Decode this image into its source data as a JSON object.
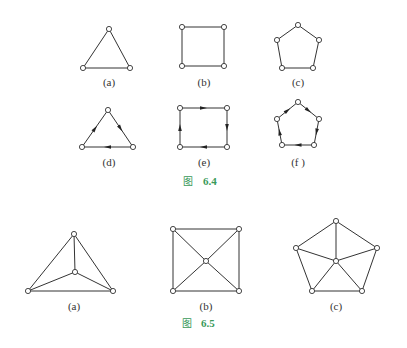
{
  "figures": [
    {
      "id": "fig-6-4",
      "caption": {
        "char": "图",
        "number": "6.4",
        "x": 190,
        "y": 184
      },
      "subfigures": [
        {
          "label": "(a)",
          "label_pos": [
            109,
            86
          ],
          "vertices": [
            [
              109,
              29
            ],
            [
              83,
              68
            ],
            [
              130,
              68
            ]
          ],
          "edges": [
            [
              0,
              1
            ],
            [
              0,
              2
            ],
            [
              1,
              2
            ]
          ],
          "directed": false
        },
        {
          "label": "(b)",
          "label_pos": [
            204,
            86
          ],
          "vertices": [
            [
              182,
              27
            ],
            [
              224,
              27
            ],
            [
              224,
              66
            ],
            [
              182,
              66
            ]
          ],
          "edges": [
            [
              0,
              1
            ],
            [
              1,
              2
            ],
            [
              2,
              3
            ],
            [
              3,
              0
            ]
          ],
          "directed": false
        },
        {
          "label": "(c)",
          "label_pos": [
            298,
            86
          ],
          "vertices": [
            [
              298,
              25
            ],
            [
              319,
              40
            ],
            [
              313,
              68
            ],
            [
              282,
              68
            ],
            [
              277,
              40
            ]
          ],
          "edges": [
            [
              0,
              1
            ],
            [
              1,
              2
            ],
            [
              2,
              3
            ],
            [
              3,
              4
            ],
            [
              4,
              0
            ]
          ],
          "directed": false
        },
        {
          "label": "(d)",
          "label_pos": [
            109,
            166
          ],
          "vertices": [
            [
              108,
              110
            ],
            [
              133,
              147
            ],
            [
              82,
              147
            ]
          ],
          "edges": [
            [
              0,
              1
            ],
            [
              1,
              2
            ],
            [
              2,
              0
            ]
          ],
          "directed": true
        },
        {
          "label": "(e)",
          "label_pos": [
            204,
            166
          ],
          "vertices": [
            [
              180,
              108
            ],
            [
              227,
              108
            ],
            [
              227,
              147
            ],
            [
              180,
              147
            ]
          ],
          "edges": [
            [
              0,
              1
            ],
            [
              1,
              2
            ],
            [
              2,
              3
            ],
            [
              3,
              0
            ]
          ],
          "directed": true
        },
        {
          "label": "(f )",
          "label_pos": [
            298,
            166
          ],
          "vertices": [
            [
              298,
              102
            ],
            [
              319,
              119
            ],
            [
              314,
              145
            ],
            [
              282,
              145
            ],
            [
              277,
              119
            ]
          ],
          "edges": [
            [
              0,
              1
            ],
            [
              1,
              2
            ],
            [
              2,
              3
            ],
            [
              3,
              4
            ],
            [
              4,
              0
            ]
          ],
          "directed": true
        }
      ]
    },
    {
      "id": "fig-6-5",
      "caption": {
        "char": "图",
        "number": "6.5",
        "x": 189,
        "y": 326
      },
      "subfigures": [
        {
          "label": "(a)",
          "label_pos": [
            74,
            310
          ],
          "vertices": [
            [
              74,
              234
            ],
            [
              28,
              291
            ],
            [
              113,
              291
            ],
            [
              75,
              272
            ]
          ],
          "edges": [
            [
              0,
              1
            ],
            [
              0,
              2
            ],
            [
              1,
              2
            ],
            [
              3,
              0
            ],
            [
              3,
              1
            ],
            [
              3,
              2
            ]
          ],
          "directed": false
        },
        {
          "label": "(b)",
          "label_pos": [
            206,
            310
          ],
          "vertices": [
            [
              173,
              229
            ],
            [
              239,
              229
            ],
            [
              239,
              291
            ],
            [
              173,
              291
            ],
            [
              206,
              261
            ]
          ],
          "edges": [
            [
              0,
              1
            ],
            [
              1,
              2
            ],
            [
              2,
              3
            ],
            [
              3,
              0
            ],
            [
              4,
              0
            ],
            [
              4,
              1
            ],
            [
              4,
              2
            ],
            [
              4,
              3
            ]
          ],
          "directed": false
        },
        {
          "label": "(c)",
          "label_pos": [
            336,
            310
          ],
          "vertices": [
            [
              336,
              221
            ],
            [
              377,
              248
            ],
            [
              362,
              291
            ],
            [
              312,
              291
            ],
            [
              296,
              248
            ],
            [
              336,
              261
            ]
          ],
          "edges": [
            [
              0,
              1
            ],
            [
              1,
              2
            ],
            [
              2,
              3
            ],
            [
              3,
              4
            ],
            [
              4,
              0
            ],
            [
              5,
              0
            ],
            [
              5,
              1
            ],
            [
              5,
              2
            ],
            [
              5,
              3
            ],
            [
              5,
              4
            ]
          ],
          "directed": false
        }
      ]
    }
  ],
  "style": {
    "caption_color": "#3a9a5a",
    "line_color": "#333333",
    "vertex_radius": 2.6
  }
}
